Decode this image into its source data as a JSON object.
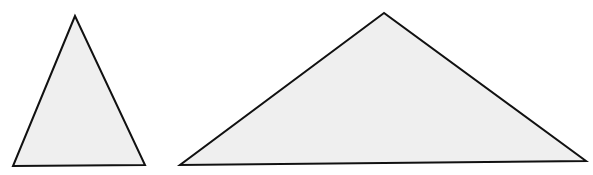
{
  "diagram": {
    "background": "#ffffff",
    "fill": "#efefef",
    "stroke": "#111111",
    "shapes": [
      {
        "id": "triangle-acute",
        "type": "triangle",
        "points": [
          [
            75,
            16
          ],
          [
            13,
            166
          ],
          [
            145,
            165
          ]
        ]
      },
      {
        "id": "triangle-obtuse",
        "type": "triangle",
        "points": [
          [
            384,
            13
          ],
          [
            180,
            165
          ],
          [
            586,
            161
          ]
        ]
      }
    ]
  }
}
